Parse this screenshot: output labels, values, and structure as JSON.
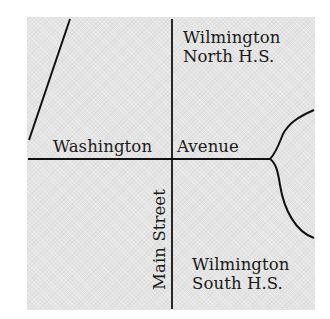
{
  "map": {
    "background_color": "#e4e4e4",
    "road_color": "#111111",
    "streets": {
      "horizontal": "Washington Avenue",
      "horizontal_part1": "Washington",
      "horizontal_part2": "Avenue",
      "vertical": "Main Street"
    },
    "landmarks": [
      {
        "line1": "Wilmington",
        "line2": "North H.S."
      },
      {
        "line1": "Wilmington",
        "line2": "South H.S."
      }
    ]
  }
}
